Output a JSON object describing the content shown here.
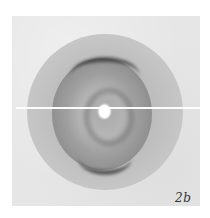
{
  "figure": {
    "panel_label": "2b",
    "colors": {
      "background": "#ffffff",
      "plate": "#e6e6e6",
      "disc": "#bdbdbd",
      "dark_arcs": "#373737",
      "beam_spot": "#ffffff"
    }
  }
}
